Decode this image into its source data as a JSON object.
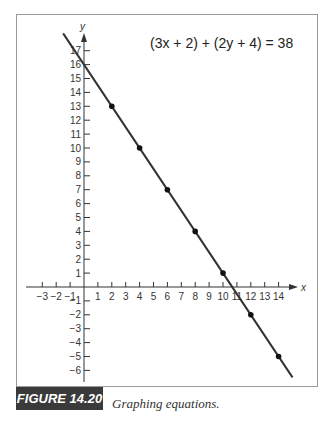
{
  "chart_data": {
    "type": "line",
    "title": "(3x + 2) + (2y + 4) = 38",
    "equation": "(3x + 2) + (2y + 4) = 38",
    "xlabel": "x",
    "ylabel": "y",
    "xlim": [
      -3,
      14
    ],
    "ylim": [
      -6,
      17
    ],
    "x_ticks": [
      -3,
      -2,
      -1,
      1,
      2,
      3,
      4,
      5,
      6,
      7,
      8,
      9,
      10,
      11,
      12,
      13,
      14
    ],
    "y_ticks": [
      -6,
      -5,
      -4,
      -3,
      -2,
      -1,
      1,
      2,
      3,
      4,
      5,
      6,
      7,
      8,
      9,
      10,
      11,
      12,
      13,
      14,
      15,
      16,
      17
    ],
    "grid": false,
    "series": [
      {
        "name": "3x + 2y = 32",
        "line": {
          "x": [
            -1.5,
            15
          ],
          "y": [
            18.25,
            -6.5
          ]
        },
        "points": [
          {
            "x": 2,
            "y": 13
          },
          {
            "x": 4,
            "y": 10
          },
          {
            "x": 6,
            "y": 7
          },
          {
            "x": 8,
            "y": 4
          },
          {
            "x": 10,
            "y": 1
          },
          {
            "x": 12,
            "y": -2
          },
          {
            "x": 14,
            "y": -5
          }
        ]
      }
    ]
  },
  "figure": {
    "label": "FIGURE 14.20",
    "caption": "Graphing equations."
  }
}
